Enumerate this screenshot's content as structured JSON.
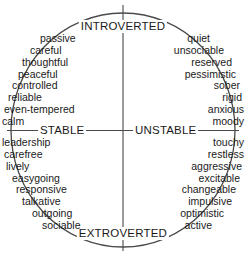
{
  "chart_data": {
    "type": "diagram",
    "shape": "ellipse",
    "axes": {
      "vertical": {
        "top_label": "INTROVERTED",
        "bottom_label": "EXTROVERTED"
      },
      "horizontal": {
        "left_label": "STABLE",
        "right_label": "UNSTABLE"
      }
    },
    "quadrants": [
      {
        "id": "introverted-stable",
        "position": "top-left",
        "align": "left",
        "traits": [
          "passive",
          "careful",
          "thoughtful",
          "peaceful",
          "controlled",
          "reliable",
          "even-tempered",
          "calm"
        ],
        "indents": [
          40,
          30,
          22,
          18,
          12,
          8,
          4,
          2
        ]
      },
      {
        "id": "introverted-unstable",
        "position": "top-right",
        "align": "right",
        "traits": [
          "quiet",
          "unsociable",
          "reserved",
          "pessimistic",
          "sober",
          "rigid",
          "anxious",
          "moody"
        ],
        "indents": [
          36,
          22,
          14,
          10,
          6,
          4,
          2,
          2
        ]
      },
      {
        "id": "stable-extroverted",
        "position": "bottom-left",
        "align": "left",
        "traits": [
          "leadership",
          "carefree",
          "lively",
          "easygoing",
          "responsive",
          "talkative",
          "outgoing",
          "sociable"
        ],
        "indents": [
          2,
          4,
          6,
          12,
          16,
          22,
          32,
          42
        ]
      },
      {
        "id": "unstable-extroverted",
        "position": "bottom-right",
        "align": "right",
        "traits": [
          "touchy",
          "restless",
          "aggressive",
          "excitable",
          "changeable",
          "impulsive",
          "optimistic",
          "active"
        ],
        "indents": [
          2,
          2,
          4,
          6,
          10,
          14,
          22,
          34
        ]
      }
    ],
    "colors": {
      "outline": "#4a4a4a",
      "axis": "#4a4a4a",
      "text": "#1a1a1a",
      "background": "#ffffff"
    }
  }
}
